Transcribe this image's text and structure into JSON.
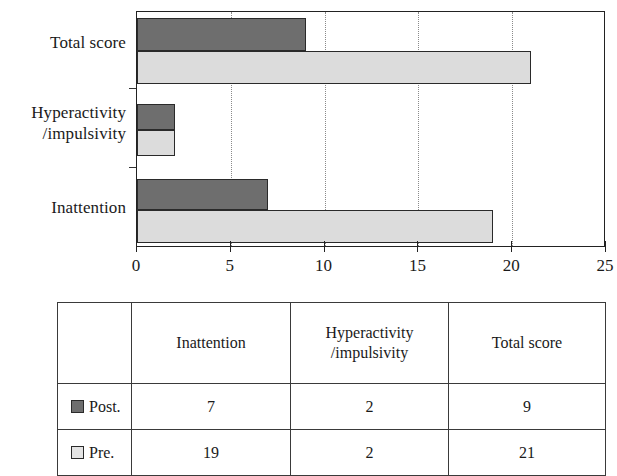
{
  "chart_data": {
    "type": "bar",
    "orientation": "horizontal",
    "title": "",
    "xlabel": "",
    "ylabel": "",
    "categories": [
      "Inattention",
      "Hyperactivity /impulsivity",
      "Total score"
    ],
    "category_lines": [
      [
        "Inattention"
      ],
      [
        "Hyperactivity",
        "/impulsivity"
      ],
      [
        "Total score"
      ]
    ],
    "series": [
      {
        "name": "Post.",
        "color": "#6e6e6e",
        "values": [
          7,
          2,
          9
        ]
      },
      {
        "name": "Pre.",
        "color": "#dcdcdc",
        "values": [
          19,
          2,
          21
        ]
      }
    ],
    "xlim": [
      0,
      25
    ],
    "xticks": [
      0,
      5,
      10,
      15,
      20,
      25
    ],
    "xticklabels": [
      "0",
      "5",
      "10",
      "15",
      "20",
      "25"
    ],
    "grid": "vertical-dotted",
    "legend_position": "table-below"
  },
  "table": {
    "headers": {
      "legend_blank": "",
      "inattention": [
        "Inattention"
      ],
      "hyperactivity": [
        "Hyperactivity",
        "/impulsivity"
      ],
      "total_score": [
        "Total score"
      ]
    },
    "rows": [
      {
        "legend_label": "Post.",
        "swatch_color": "#6e6e6e",
        "inattention": "7",
        "hyperactivity": "2",
        "total_score": "9"
      },
      {
        "legend_label": "Pre.",
        "swatch_color": "#e4e4e4",
        "inattention": "19",
        "hyperactivity": "2",
        "total_score": "21"
      }
    ]
  }
}
